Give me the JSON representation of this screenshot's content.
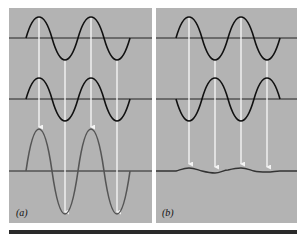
{
  "figure": {
    "panels": [
      {
        "id": "a",
        "label": "(a)",
        "description": "Constructive interference — two in-phase waves add to a wave of double amplitude",
        "wave1": {
          "phase": "in-phase",
          "amplitude": 1
        },
        "wave2": {
          "phase": "in-phase",
          "amplitude": 1
        },
        "result": {
          "amplitude": 2,
          "color": "#555555"
        }
      },
      {
        "id": "b",
        "label": "(b)",
        "description": "Destructive interference — two out-of-phase waves cancel to a nearly flat line",
        "wave1": {
          "phase": "0",
          "amplitude": 1
        },
        "wave2": {
          "phase": "180deg",
          "amplitude": 1
        },
        "result": {
          "amplitude": 0,
          "color": "#555555"
        }
      }
    ],
    "colors": {
      "panel_bg": "#b3b3b3",
      "wave": "#111111",
      "axis": "#222222",
      "arrow": "#f4f4f4",
      "result_wave": "#555555",
      "bottom_bar": "#2a2a2a"
    }
  }
}
